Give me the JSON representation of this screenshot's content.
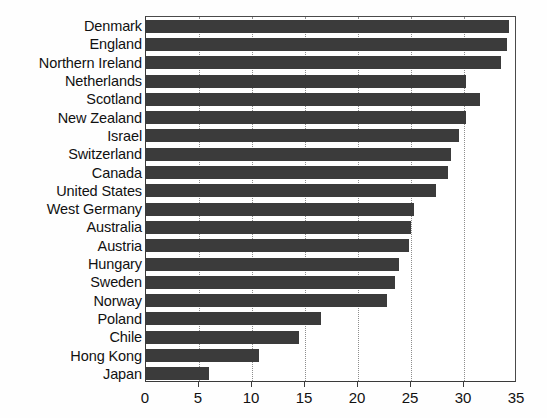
{
  "chart_data": {
    "type": "bar",
    "orientation": "horizontal",
    "title": "",
    "subtitle": "",
    "xlabel": "",
    "ylabel": "",
    "xlim": [
      0,
      35
    ],
    "xticks": [
      0,
      5,
      10,
      15,
      20,
      25,
      30,
      35
    ],
    "xtick_labels": [
      "0",
      "5",
      "10",
      "15",
      "20",
      "25",
      "30",
      "35"
    ],
    "grid": "vertical-dotted",
    "legend": "none",
    "bar_color": "#3b3b3b",
    "categories": [
      "Denmark",
      "England",
      "Northern Ireland",
      "Netherlands",
      "Scotland",
      "New Zealand",
      "Israel",
      "Switzerland",
      "Canada",
      "United States",
      "West Germany",
      "Australia",
      "Austria",
      "Hungary",
      "Sweden",
      "Norway",
      "Poland",
      "Chile",
      "Hong Kong",
      "Japan"
    ],
    "values": [
      34.2,
      34.1,
      33.5,
      30.2,
      31.5,
      30.2,
      29.5,
      28.8,
      28.5,
      27.4,
      25.3,
      25.0,
      24.8,
      23.9,
      23.5,
      22.7,
      16.5,
      14.4,
      10.7,
      5.9
    ]
  }
}
